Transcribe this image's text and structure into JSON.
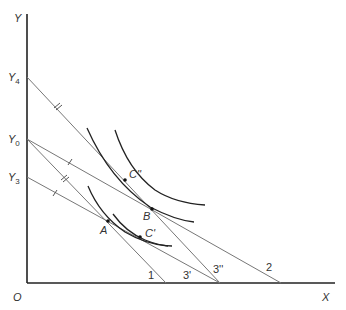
{
  "diagram": {
    "type": "indifference-curve budget lines",
    "colors": {
      "axis": "#222222",
      "line": "#777777",
      "curve": "#222222",
      "text": "#333333"
    },
    "axes": {
      "origin_label": "O",
      "x_label": "X",
      "y_label": "Y",
      "y_intercepts": [
        {
          "id": "Y4",
          "base": "Y",
          "sub": "4"
        },
        {
          "id": "Y0",
          "base": "Y",
          "sub": "0"
        },
        {
          "id": "Y3",
          "base": "Y",
          "sub": "3"
        }
      ]
    },
    "budget_lines": [
      {
        "label": "1",
        "from": "Y0"
      },
      {
        "label": "2",
        "from": "Y0"
      },
      {
        "label": "3'",
        "from": "Y3"
      },
      {
        "label": "3''",
        "from": "Y4"
      }
    ],
    "points": [
      {
        "label": "A"
      },
      {
        "label": "B"
      },
      {
        "label": "C'"
      },
      {
        "label": "C''"
      }
    ]
  }
}
